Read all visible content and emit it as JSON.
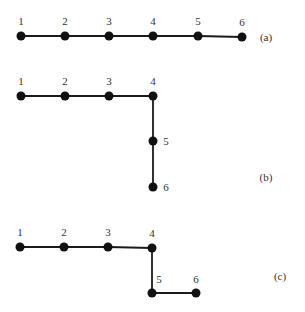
{
  "diagrams": [
    {
      "id": "a",
      "caption": "(a)",
      "caption_pos": [
        266,
        41
      ],
      "nodes": [
        {
          "label": "1",
          "x": 21,
          "y": 36,
          "lx": 21,
          "ly": 25
        },
        {
          "label": "2",
          "x": 65,
          "y": 36,
          "lx": 65,
          "ly": 25
        },
        {
          "label": "3",
          "x": 109,
          "y": 36,
          "lx": 109,
          "ly": 25
        },
        {
          "label": "4",
          "x": 153,
          "y": 36,
          "lx": 153,
          "ly": 25
        },
        {
          "label": "5",
          "x": 198,
          "y": 36,
          "lx": 198,
          "ly": 25
        },
        {
          "label": "6",
          "x": 242,
          "y": 37,
          "lx": 242,
          "ly": 26
        }
      ],
      "edges": [
        [
          0,
          1
        ],
        [
          1,
          2
        ],
        [
          2,
          3
        ],
        [
          3,
          4
        ],
        [
          4,
          5
        ]
      ]
    },
    {
      "id": "b",
      "caption": "(b)",
      "caption_pos": [
        266,
        181
      ],
      "nodes": [
        {
          "label": "1",
          "x": 21,
          "y": 96,
          "lx": 21,
          "ly": 85
        },
        {
          "label": "2",
          "x": 65,
          "y": 96,
          "lx": 65,
          "ly": 85
        },
        {
          "label": "3",
          "x": 109,
          "y": 96,
          "lx": 109,
          "ly": 85
        },
        {
          "label": "4",
          "x": 153,
          "y": 96,
          "lx": 153,
          "ly": 85
        },
        {
          "label": "5",
          "x": 153,
          "y": 141,
          "lx": 166,
          "ly": 145
        },
        {
          "label": "6",
          "x": 153,
          "y": 187,
          "lx": 166,
          "ly": 191
        }
      ],
      "edges": [
        [
          0,
          1
        ],
        [
          1,
          2
        ],
        [
          2,
          3
        ],
        [
          3,
          4
        ],
        [
          4,
          5
        ]
      ]
    },
    {
      "id": "c",
      "caption": "(c)",
      "caption_pos": [
        280,
        280
      ],
      "nodes": [
        {
          "label": "1",
          "x": 20,
          "y": 247,
          "lx": 20,
          "ly": 236
        },
        {
          "label": "2",
          "x": 64,
          "y": 247,
          "lx": 64,
          "ly": 236
        },
        {
          "label": "3",
          "x": 108,
          "y": 247,
          "lx": 108,
          "ly": 236
        },
        {
          "label": "4",
          "x": 152,
          "y": 248,
          "lx": 152,
          "ly": 237
        },
        {
          "label": "5",
          "x": 152,
          "y": 293,
          "lx": 159,
          "ly": 283
        },
        {
          "label": "6",
          "x": 196,
          "y": 293,
          "lx": 196,
          "ly": 283
        }
      ],
      "edges": [
        [
          0,
          1
        ],
        [
          1,
          2
        ],
        [
          2,
          3
        ],
        [
          3,
          4
        ],
        [
          4,
          5
        ]
      ]
    }
  ]
}
